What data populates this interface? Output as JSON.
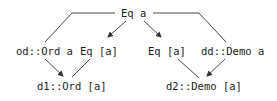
{
  "diagram": {
    "type": "class-hierarchy",
    "nodes": {
      "root": "Eq a",
      "od_ord": "od::Ord a",
      "eq_list_left": "Eq [a]",
      "eq_list_right": "Eq [a]",
      "dd_demo": "dd::Demo a",
      "d1_ord": "d1::Ord [a]",
      "d2_demo": "d2::Demo [a]"
    },
    "edges": [
      {
        "from": "root",
        "to": "od_ord",
        "arrow": false
      },
      {
        "from": "root",
        "to": "eq_list_left",
        "arrow": true
      },
      {
        "from": "root",
        "to": "eq_list_right",
        "arrow": true
      },
      {
        "from": "root",
        "to": "dd_demo",
        "arrow": false
      },
      {
        "from": "od_ord",
        "to": "d1_ord",
        "arrow": true
      },
      {
        "from": "eq_list_left",
        "to": "d1_ord",
        "arrow": false
      },
      {
        "from": "eq_list_right",
        "to": "d2_demo",
        "arrow": false
      },
      {
        "from": "dd_demo",
        "to": "d2_demo",
        "arrow": true
      }
    ],
    "colors": {
      "line": "#333333",
      "text": "#1a1a1a",
      "background": "#ffffff"
    }
  }
}
